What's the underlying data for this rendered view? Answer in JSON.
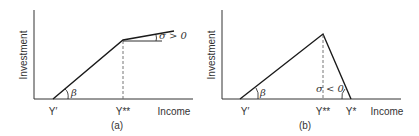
{
  "figure": {
    "panels": [
      {
        "id": "a",
        "caption": "(a)",
        "ylabel": "Investment",
        "xlabel": "Income",
        "x_ticks": [
          "Y′",
          "Y**"
        ],
        "beta_label": "β",
        "sigma_label": "σ > 0",
        "description": "Investment rises linearly from Y′ with slope β up to Y**, then continues rising with smaller positive slope σ > 0"
      },
      {
        "id": "b",
        "caption": "(b)",
        "ylabel": "Investment",
        "xlabel": "Income",
        "x_ticks": [
          "Y′",
          "Y**",
          "Y*"
        ],
        "beta_label": "β",
        "sigma_label": "σ < 0",
        "description": "Investment rises linearly from Y′ with slope β up to Y**, then falls with negative slope σ < 0 reaching zero at Y*"
      }
    ],
    "colors": {
      "line": "#1a1a1a",
      "axis": "#333333",
      "dashed": "#666666",
      "text": "#333333"
    }
  }
}
